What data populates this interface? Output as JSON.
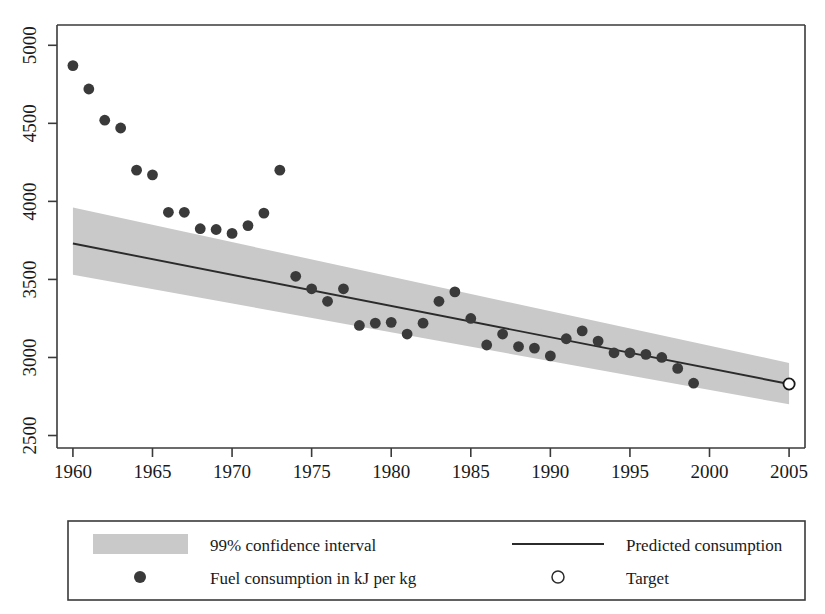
{
  "chart_data": {
    "type": "scatter",
    "title": "",
    "subtitle": "",
    "xlabel": "",
    "ylabel": "",
    "xlim": [
      1959.0,
      2006.0
    ],
    "ylim": [
      2420,
      5130
    ],
    "grid": false,
    "legend_position": "below-plot",
    "x_ticks": [
      "1960",
      "1965",
      "1970",
      "1975",
      "1980",
      "1985",
      "1990",
      "1995",
      "2000",
      "2005"
    ],
    "x_tick_values": [
      1960,
      1965,
      1970,
      1975,
      1980,
      1985,
      1990,
      1995,
      2000,
      2005
    ],
    "y_ticks": [
      "2500",
      "3000",
      "3500",
      "4000",
      "4500",
      "5000"
    ],
    "y_tick_values": [
      2500,
      3000,
      3500,
      4000,
      4500,
      5000
    ],
    "series": [
      {
        "name": "Fuel consumption in kJ per kg",
        "type": "scatter",
        "marker": "filled-circle",
        "color": "#3a3a3a",
        "x": [
          1960,
          1961,
          1962,
          1963,
          1964,
          1965,
          1966,
          1967,
          1968,
          1969,
          1970,
          1971,
          1972,
          1973,
          1974,
          1975,
          1976,
          1977,
          1978,
          1979,
          1980,
          1981,
          1982,
          1983,
          1984,
          1985,
          1986,
          1987,
          1988,
          1989,
          1990,
          1991,
          1992,
          1993,
          1994,
          1995,
          1996,
          1997,
          1998,
          1999
        ],
        "y": [
          4870,
          4720,
          4520,
          4470,
          4200,
          4170,
          3930,
          3930,
          3825,
          3820,
          3795,
          3845,
          3925,
          4200,
          3520,
          3440,
          3360,
          3440,
          3205,
          3220,
          3225,
          3150,
          3220,
          3360,
          3420,
          3250,
          3080,
          3150,
          3070,
          3060,
          3010,
          3120,
          3170,
          3105,
          3030,
          3030,
          3020,
          3000,
          2930,
          2835
        ]
      },
      {
        "name": "Predicted consumption",
        "type": "line",
        "color": "#2b2b2b",
        "x": [
          1960,
          2005
        ],
        "y": [
          3730,
          2830
        ]
      },
      {
        "name": "99% confidence interval",
        "type": "area",
        "color": "#c9c9c9",
        "x": [
          1960,
          2005
        ],
        "upper": [
          3960,
          2965
        ],
        "lower": [
          3530,
          2700
        ]
      },
      {
        "name": "Target",
        "type": "scatter",
        "marker": "open-circle",
        "color": "#ffffff",
        "x": [
          2005
        ],
        "y": [
          2830
        ]
      }
    ]
  },
  "legend": {
    "entries": [
      {
        "key": "band-swatch",
        "label": "99% confidence interval"
      },
      {
        "key": "line-swatch",
        "label": "Predicted consumption"
      },
      {
        "key": "dot-swatch",
        "label": "Fuel consumption in kJ per kg"
      },
      {
        "key": "open-dot-swatch",
        "label": "Target"
      }
    ]
  },
  "colors": {
    "axis": "#3a3a3a",
    "point": "#3a3a3a",
    "line": "#2b2b2b",
    "band": "#c9c9c9",
    "background": "#ffffff"
  }
}
